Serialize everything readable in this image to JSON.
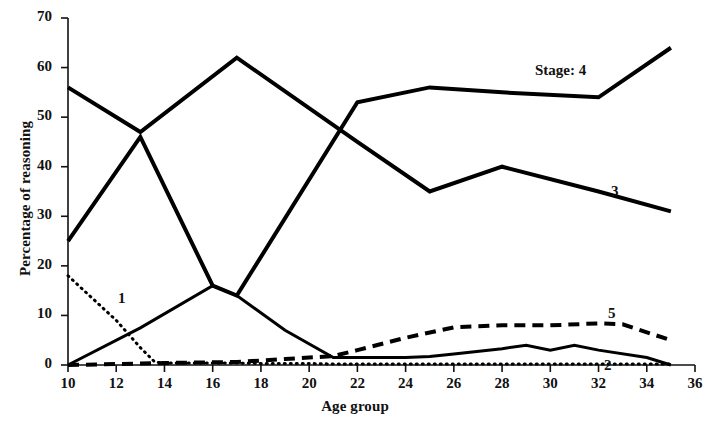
{
  "chart_data": {
    "type": "line",
    "title": "",
    "xlabel": "Age group",
    "ylabel": "Percentage of reasoning",
    "xlim": [
      10,
      36
    ],
    "ylim": [
      0,
      70
    ],
    "xticks": [
      10,
      12,
      14,
      16,
      18,
      20,
      22,
      24,
      26,
      28,
      30,
      32,
      34,
      36
    ],
    "yticks": [
      0,
      10,
      20,
      30,
      40,
      50,
      60,
      70
    ],
    "xtick_labels": [
      "10",
      "12",
      "14",
      "16",
      "18",
      "20",
      "22",
      "24",
      "26",
      "28",
      "30",
      "32",
      "34",
      "36"
    ],
    "ytick_labels": [
      "0",
      "10",
      "20",
      "30",
      "40",
      "50",
      "60",
      "70"
    ],
    "grid": false,
    "legend_position": "inline-annotations",
    "series": [
      {
        "name": "1",
        "label": "1",
        "style": "dotted",
        "linewidth": 3,
        "color": "#000000",
        "x": [
          10,
          11,
          12,
          13,
          13.6,
          14,
          15,
          16,
          17,
          18,
          19,
          20,
          21,
          22,
          24,
          26,
          28,
          30,
          32,
          34,
          35
        ],
        "y": [
          18,
          13.5,
          9,
          3.5,
          0.6,
          0.4,
          0.4,
          0.4,
          0.4,
          0.3,
          0.3,
          0.3,
          0.2,
          0.2,
          0.2,
          0.2,
          0.2,
          0.2,
          0.2,
          0.2,
          0.2
        ]
      },
      {
        "name": "2",
        "label": "2",
        "style": "solid",
        "linewidth": 3,
        "color": "#000000",
        "x": [
          10,
          13,
          16,
          17,
          19,
          21,
          22,
          24,
          25,
          26,
          28,
          29,
          30,
          31,
          32,
          34,
          35
        ],
        "y": [
          0,
          7.5,
          16,
          14,
          7,
          1.5,
          1.5,
          1.5,
          1.7,
          2.2,
          3.3,
          4,
          3,
          4,
          3,
          1.5,
          0
        ]
      },
      {
        "name": "3",
        "label": "3",
        "style": "solid",
        "linewidth": 4,
        "color": "#000000",
        "x": [
          10,
          13,
          17,
          22,
          25,
          28,
          32,
          35
        ],
        "y": [
          56,
          47,
          62,
          45,
          35,
          40,
          35,
          31
        ]
      },
      {
        "name": "4",
        "label": "Stage: 4",
        "style": "solid",
        "linewidth": 4,
        "color": "#000000",
        "x": [
          10,
          13,
          16,
          17,
          22,
          25,
          28,
          32,
          35
        ],
        "y": [
          25,
          46,
          16,
          14,
          53,
          56,
          55,
          54,
          64
        ]
      },
      {
        "name": "5",
        "label": "5",
        "style": "dashed",
        "linewidth": 4,
        "color": "#000000",
        "x": [
          10,
          14,
          17,
          19,
          21,
          22,
          24,
          26,
          28,
          30,
          32,
          33,
          35
        ],
        "y": [
          0,
          0.4,
          0.6,
          1.2,
          1.8,
          3,
          5.5,
          7.6,
          8,
          8,
          8.4,
          8.2,
          5
        ]
      }
    ],
    "annotations": [
      {
        "name": "series-label-1",
        "text": "1",
        "x_px": 118,
        "y_px": 290
      },
      {
        "name": "series-label-2",
        "text": "2",
        "x_px": 604,
        "y_px": 357
      },
      {
        "name": "series-label-3",
        "text": "3",
        "x_px": 611,
        "y_px": 183
      },
      {
        "name": "series-label-4",
        "text": "Stage: 4",
        "x_px": 535,
        "y_px": 62
      },
      {
        "name": "series-label-5",
        "text": "5",
        "x_px": 608,
        "y_px": 305
      }
    ]
  }
}
